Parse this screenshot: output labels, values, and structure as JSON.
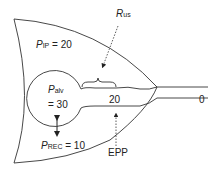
{
  "diagram": {
    "labels": {
      "p_ip": {
        "symbol": "P",
        "subscript": "IP",
        "value": "= 20"
      },
      "r_us": {
        "symbol": "R",
        "subscript": "us"
      },
      "p_alv": {
        "symbol": "P",
        "subscript": "alv",
        "value": "= 30"
      },
      "p_rec": {
        "symbol": "P",
        "subscript": "REC",
        "value": "= 10"
      },
      "airway_pressure": "20",
      "outlet_pressure": "0",
      "epp": "EPP"
    },
    "colors": {
      "stroke": "#333333",
      "text": "#222222",
      "background": "#ffffff"
    }
  }
}
